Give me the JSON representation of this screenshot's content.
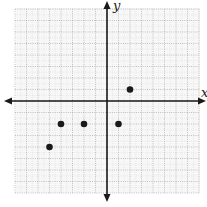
{
  "chart_data": {
    "type": "scatter",
    "title": "",
    "xlabel": "x",
    "ylabel": "y",
    "xlim": [
      -8,
      8
    ],
    "ylim": [
      -8,
      8
    ],
    "grid": true,
    "tick_labels_shown": false,
    "points": [
      {
        "x": 2,
        "y": 1
      },
      {
        "x": -4,
        "y": -2
      },
      {
        "x": -2,
        "y": -2
      },
      {
        "x": 1,
        "y": -2
      },
      {
        "x": -5,
        "y": -4
      }
    ]
  },
  "labels": {
    "x_axis": "x",
    "y_axis": "y"
  },
  "colors": {
    "axis": "#1a1a1a",
    "grid": "#9a9a9a",
    "grid_minor": "#cfcfcf",
    "point": "#1a1a1a",
    "background": "#f7f7f7"
  }
}
